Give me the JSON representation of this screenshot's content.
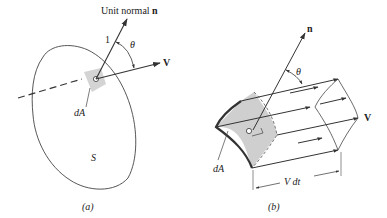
{
  "figure_a": {
    "caption": "(a)",
    "normal_label_prefix": "Unit normal ",
    "normal_label_symbol": "n",
    "unit_length_label": "1",
    "angle_label": "θ",
    "velocity_label": "V",
    "area_label": "dA",
    "surface_label": "S"
  },
  "figure_b": {
    "caption": "(b)",
    "normal_label": "n",
    "angle_label": "θ",
    "velocity_label": "V",
    "area_label": "dA",
    "length_label": "V dt"
  },
  "colors": {
    "line": "#333333",
    "patch_fill": "#cfcfcf",
    "text": "#222222"
  }
}
